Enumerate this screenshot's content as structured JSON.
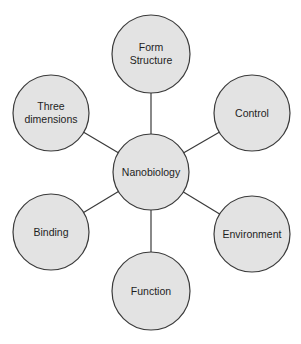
{
  "diagram": {
    "type": "hub-and-spoke",
    "center": {
      "id": "nanobiology",
      "label": [
        "Nanobiology"
      ],
      "cx": 151,
      "cy": 172,
      "r": 38
    },
    "nodes": [
      {
        "id": "form-structure",
        "label": [
          "Form",
          "Structure"
        ],
        "cx": 151,
        "cy": 54,
        "r": 39
      },
      {
        "id": "control",
        "label": [
          "Control"
        ],
        "cx": 252,
        "cy": 113,
        "r": 38
      },
      {
        "id": "environment",
        "label": [
          "Environment"
        ],
        "cx": 252,
        "cy": 234,
        "r": 38
      },
      {
        "id": "function",
        "label": [
          "Function"
        ],
        "cx": 151,
        "cy": 291,
        "r": 39
      },
      {
        "id": "binding",
        "label": [
          "Binding"
        ],
        "cx": 51,
        "cy": 232,
        "r": 38
      },
      {
        "id": "three-dimensions",
        "label": [
          "Three",
          "dimensions"
        ],
        "cx": 51,
        "cy": 113,
        "r": 38
      }
    ],
    "colors": {
      "fill": "#e3e3e3",
      "stroke": "#3a3a3a",
      "text": "#1e1e1e"
    }
  }
}
